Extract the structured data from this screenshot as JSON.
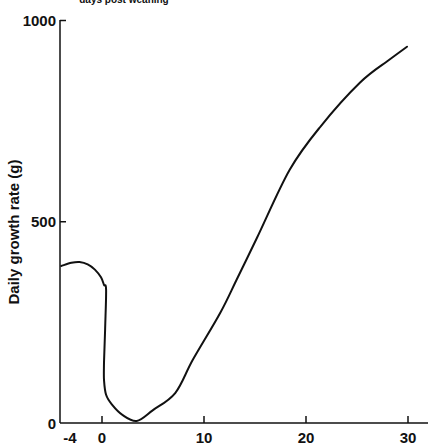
{
  "chart_data": {
    "type": "line",
    "title": "",
    "top_label": "days post weaning",
    "xlabel": "days post weaning",
    "ylabel": "Daily growth rate (g)",
    "xlim": [
      -4,
      32
    ],
    "ylim": [
      0,
      1000
    ],
    "x_ticks": [
      -4,
      0,
      10,
      20,
      30
    ],
    "x_tick_labels": [
      "-4",
      "0",
      "10",
      "20",
      "30"
    ],
    "y_ticks": [
      0,
      500,
      1000
    ],
    "y_tick_labels": [
      "0",
      "500",
      "1000"
    ],
    "grid": false,
    "legend": null,
    "series": [
      {
        "name": "Daily growth rate",
        "color": "#111111",
        "x": [
          -4.0,
          -3.0,
          -2.2,
          -1.4,
          -0.7,
          -0.1,
          0.2,
          0.4,
          0.3,
          0.2,
          0.2,
          0.4,
          1.0,
          2.0,
          3.4,
          5.0,
          7.2,
          8.9,
          11.6,
          13.2,
          15.2,
          18.4,
          21.4,
          25.3,
          28.2,
          29.9
        ],
        "y": [
          390,
          398,
          400,
          394,
          381,
          362,
          343,
          331,
          231,
          150,
          107,
          70,
          45,
          20,
          5,
          32,
          75,
          157,
          274,
          356,
          460,
          629,
          736,
          846,
          903,
          935
        ]
      }
    ]
  },
  "axes": {
    "y_title": "Daily growth rate (g)",
    "top_caption": "days post weaning"
  }
}
